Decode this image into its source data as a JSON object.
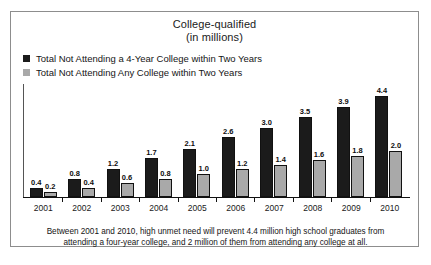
{
  "chart_data": {
    "type": "bar",
    "title": "College-qualified",
    "subtitle": "(in millions)",
    "xlabel": "",
    "ylabel": "",
    "ylim": [
      0,
      4.4
    ],
    "grid": false,
    "legend_position": "top-left",
    "categories": [
      "2001",
      "2002",
      "2003",
      "2004",
      "2005",
      "2006",
      "2007",
      "2008",
      "2009",
      "2010"
    ],
    "series": [
      {
        "name": "Total Not Attending a 4-Year College within Two Years",
        "color": "#1b1b1b",
        "values": [
          0.4,
          0.8,
          1.2,
          1.7,
          2.1,
          2.6,
          3.0,
          3.5,
          3.9,
          4.4
        ],
        "labels": [
          "0.4",
          "0.8",
          "1.2",
          "1.7",
          "2.1",
          "2.6",
          "3.0",
          "3.5",
          "3.9",
          "4.4"
        ]
      },
      {
        "name": "Total Not Attending Any College within Two Years",
        "color": "#a9a9a9",
        "values": [
          0.2,
          0.4,
          0.6,
          0.8,
          1.0,
          1.2,
          1.4,
          1.6,
          1.8,
          2.0
        ],
        "labels": [
          "0.2",
          "0.4",
          "0.6",
          "0.8",
          "1.0",
          "1.2",
          "1.4",
          "1.6",
          "1.8",
          "2.0"
        ]
      }
    ],
    "annotation": "Between 2001 and 2010, high unmet need will prevent 4.4 million high school graduates from attending a four-year college, and 2 million of them from attending any college at all."
  },
  "caption": {
    "line1": "Between 2001 and 2010, high unmet need will prevent 4.4 million high school graduates from",
    "line2": "attending a four-year college, and 2 million of them from attending any college at all."
  }
}
